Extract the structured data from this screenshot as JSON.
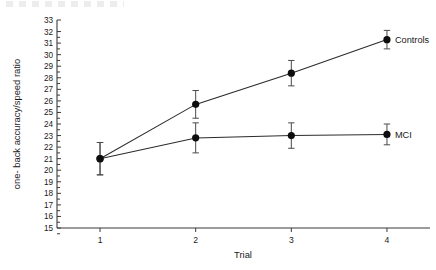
{
  "chart_data": {
    "type": "line",
    "title": "",
    "xlabel": "Trial",
    "ylabel": "one- back accuracy/speed ratio",
    "categories": [
      "1",
      "2",
      "3",
      "4"
    ],
    "x": [
      1,
      2,
      3,
      4
    ],
    "xlim": [
      0.55,
      4.45
    ],
    "ylim": [
      15,
      33
    ],
    "yticks": [
      15,
      16,
      17,
      18,
      19,
      20,
      21,
      22,
      23,
      24,
      25,
      26,
      27,
      28,
      29,
      30,
      31,
      32,
      33
    ],
    "ytick_labels": [
      "15",
      "16",
      "17",
      "18",
      "19",
      "20",
      "21",
      "22",
      "23",
      "24",
      "25",
      "26",
      "27",
      "28",
      "29",
      "30",
      "31",
      "32",
      "33"
    ],
    "xtick_labels": [
      "1",
      "2",
      "3",
      "4"
    ],
    "grid": false,
    "legend_position": "inline-right-of-last-point",
    "marker": "filled-circle",
    "errorbars": true,
    "series": [
      {
        "name": "Controls",
        "label": "Controls",
        "color": "#0d0d0d",
        "values": [
          21.0,
          25.7,
          28.4,
          31.3
        ],
        "err_low": [
          1.4,
          1.2,
          1.1,
          0.8
        ],
        "err_high": [
          1.4,
          1.2,
          1.1,
          0.8
        ]
      },
      {
        "name": "MCI",
        "label": "MCI",
        "color": "#0d0d0d",
        "values": [
          21.0,
          22.8,
          23.0,
          23.1
        ],
        "err_low": [
          1.4,
          1.3,
          1.1,
          0.9
        ],
        "err_high": [
          1.4,
          1.3,
          1.1,
          0.9
        ]
      }
    ]
  },
  "axes": {
    "y_axis_title": "one- back accuracy/speed ratio",
    "x_axis_title": "Trial"
  },
  "labels": {
    "controls": "Controls",
    "mci": "MCI"
  }
}
